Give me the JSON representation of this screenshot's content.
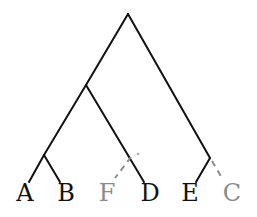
{
  "diagram": {
    "type": "phylogenetic-tree",
    "colors": {
      "solid": "#111111",
      "faded": "#8a8a8a",
      "background": "#ffffff"
    },
    "nodes": {
      "root": {
        "x": 128,
        "y": 14
      },
      "n_ABFD": {
        "x": 86,
        "y": 85
      },
      "n_AB": {
        "x": 44,
        "y": 155
      },
      "n_EC": {
        "x": 210,
        "y": 158
      }
    },
    "leaves": [
      {
        "label": "A",
        "x": 25,
        "y": 200,
        "edge_end": {
          "x": 29,
          "y": 182
        },
        "parent": "n_AB",
        "style": "solid"
      },
      {
        "label": "B",
        "x": 66,
        "y": 200,
        "edge_end": {
          "x": 60,
          "y": 182
        },
        "parent": "n_AB",
        "style": "solid"
      },
      {
        "label": "F",
        "x": 107,
        "y": 200,
        "edge_end": {
          "x": 115,
          "y": 178
        },
        "parent": "on D-branch near (137,153)",
        "style": "dashed"
      },
      {
        "label": "D",
        "x": 150,
        "y": 200,
        "edge_end": {
          "x": 144,
          "y": 182
        },
        "parent": "n_ABFD",
        "style": "solid"
      },
      {
        "label": "E",
        "x": 190,
        "y": 200,
        "edge_end": {
          "x": 196,
          "y": 182
        },
        "parent": "n_EC",
        "style": "solid"
      },
      {
        "label": "C",
        "x": 232,
        "y": 200,
        "edge_end": {
          "x": 222,
          "y": 178
        },
        "parent": "n_EC",
        "style": "dashed"
      }
    ]
  }
}
